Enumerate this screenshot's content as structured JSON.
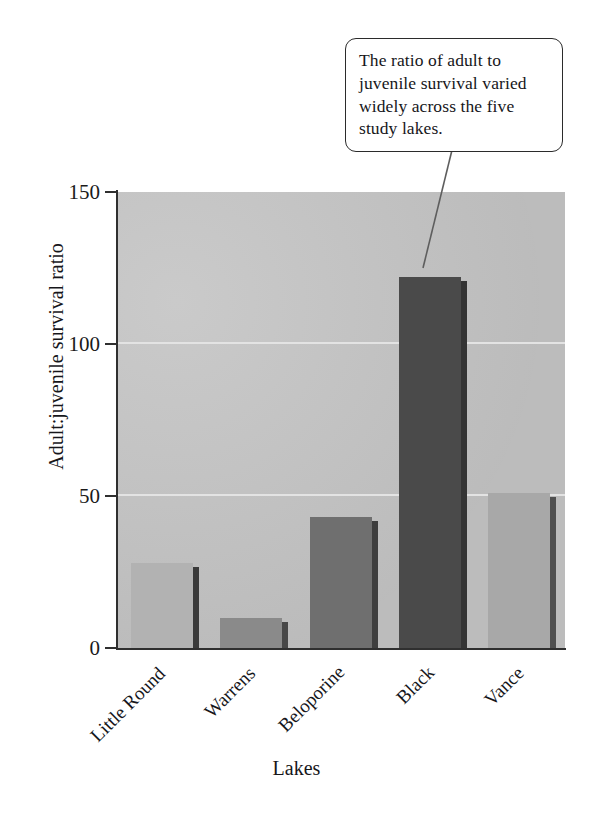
{
  "callout": {
    "text": "The ratio of adult to juvenile survival varied widely across the five study lakes."
  },
  "chart_data": {
    "type": "bar",
    "title": "",
    "xlabel": "Lakes",
    "ylabel": "Adult:juvenile survival ratio",
    "categories": [
      "Little Round",
      "Warrens",
      "Beloporine",
      "Black",
      "Vance"
    ],
    "values": [
      28,
      10,
      43,
      122,
      51
    ],
    "ylim": [
      0,
      150
    ],
    "yticks": [
      0,
      50,
      100,
      150
    ],
    "ytick_labels": [
      "0",
      "50",
      "100",
      "150"
    ],
    "grid": "horizontal",
    "legend": "none",
    "bar_colors": [
      "#b2b2b2",
      "#8a8a8a",
      "#6f6f6f",
      "#4a4a4a",
      "#a8a8a8"
    ],
    "bar_side_colors": [
      "#3a3a3a",
      "#474747",
      "#3e3e3e",
      "#343434",
      "#4f4f4f"
    ],
    "plot_background": "#c4c4c4",
    "gridline_color": "#e3e3e3",
    "axis_color": "#2f2f2f"
  }
}
